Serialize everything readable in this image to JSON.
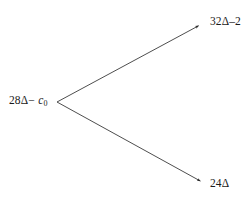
{
  "figure": {
    "type": "branching-diagram",
    "background_color": "#ffffff",
    "line_color": "#3a3a3a",
    "text_color": "#1a1a1a",
    "nodes": {
      "root": {
        "text": "28Δ− c0",
        "prefix": "28Δ−",
        "variable": "c",
        "subscript": "0",
        "x": 9,
        "y": 94
      },
      "upper": {
        "text": "32Δ–2",
        "x": 210,
        "y": 15
      },
      "lower": {
        "text": "24Δ",
        "x": 210,
        "y": 177
      }
    },
    "edges": [
      {
        "name": "edge-to-upper",
        "from_x": 57,
        "from_y": 102,
        "to_x": 200,
        "to_y": 25,
        "arrowhead": true
      },
      {
        "name": "edge-to-lower",
        "from_x": 57,
        "from_y": 102,
        "to_x": 202,
        "to_y": 182,
        "arrowhead": true
      }
    ]
  }
}
